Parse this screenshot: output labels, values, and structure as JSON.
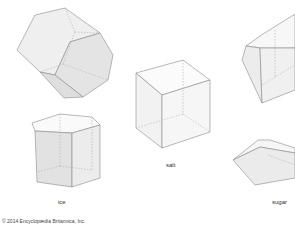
{
  "figure": {
    "crystals": [
      {
        "name": "ice",
        "label": "ice"
      },
      {
        "name": "salt",
        "label": "salt"
      },
      {
        "name": "sugar",
        "label": "sugar"
      }
    ],
    "copyright": "© 2014 Encyclopædia Britannica, Inc.",
    "colors": {
      "edge": "#8a8a8a",
      "face_light": "#f4f4f4",
      "face_mid": "#e6e6e6",
      "face_dark": "#d8d8d8",
      "hidden_edge": "#b0b0b0"
    }
  }
}
